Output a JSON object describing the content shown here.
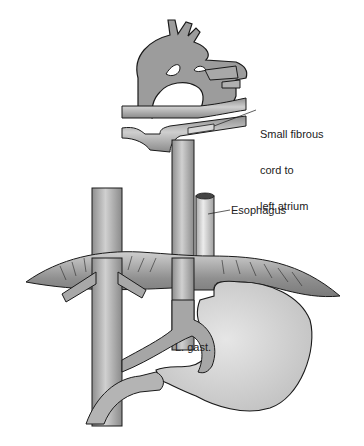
{
  "figure": {
    "type": "anatomical-illustration",
    "labels": {
      "fibrous_cord": [
        "Small fibrous",
        "cord to",
        "left atrium"
      ],
      "esophagus": "Esophagus",
      "left_gastric": "L. gast."
    },
    "colors": {
      "vessel_fill": "#9a9a9a",
      "vessel_light": "#c8c8c8",
      "organ_fill": "#d9d9d9",
      "diaphragm_fill": "#8c8c8c",
      "outline": "#1a1a1a",
      "background": "#ffffff"
    }
  }
}
